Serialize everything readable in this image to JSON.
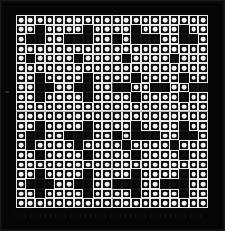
{
  "artwork": {
    "title": "",
    "medium_appearance": "op-art grid of circles in squares",
    "grid": {
      "columns": 20,
      "rows": 20,
      "cell_states": {
        "light": "white square tile with white circle",
        "dark": "black square tile"
      },
      "matrix": [
        "00000000000000000000",
        "00100001000010000100",
        "01100111001011100110",
        "00000000000000000000",
        "01000010000100001000",
        "00000000000000000000",
        "00100001000010000100",
        "00110011001100110011",
        "00100001000010000100",
        "00000000000000000000",
        "00000000000000000000",
        "00100001000010000100",
        "01100111001011100110",
        "01000010000100001000",
        "00100001000010000100",
        "00000000000000000000",
        "00100001000010000100",
        "01110011001110011100",
        "00100001000010000100",
        "00000000000000000000"
      ]
    },
    "palette": {
      "background": "#0a0a0a",
      "mount": "#070707",
      "tile_light": "#f2f2f2",
      "tile_dark": "#050505",
      "divider": "#8d8d8d"
    },
    "marks": {
      "left_blemish": "~"
    }
  }
}
